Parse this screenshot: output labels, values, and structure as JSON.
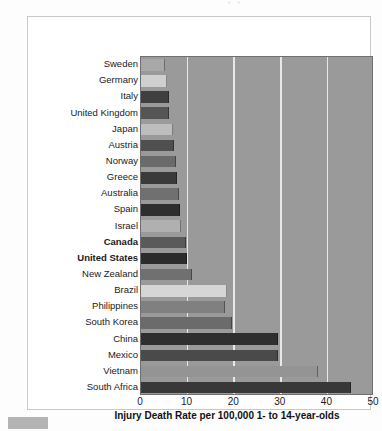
{
  "figure": {
    "top_fragment": "· ·",
    "corner_artifact_name": "scan-artifact-block"
  },
  "chart_data": {
    "type": "bar",
    "orientation": "horizontal",
    "title": "",
    "xlabel": "Injury Death Rate per 100,000 1- to 14-year-olds",
    "ylabel": "",
    "xlim": [
      0,
      50
    ],
    "xticks": [
      0,
      10,
      20,
      30,
      40,
      50
    ],
    "xtick_labels": [
      "0",
      "10",
      "20",
      "30",
      "40",
      "50"
    ],
    "grid": true,
    "grid_axis": "x",
    "legend": "none",
    "plot_background": "#9a9a9a",
    "gridline_color": "#e8e8e8",
    "categories": [
      "Sweden",
      "Germany",
      "Italy",
      "United Kingdom",
      "Japan",
      "Austria",
      "Norway",
      "Greece",
      "Australia",
      "Spain",
      "Israel",
      "Canada",
      "United States",
      "New Zealand",
      "Brazil",
      "Philippines",
      "South Korea",
      "China",
      "Mexico",
      "Vietnam",
      "South Africa"
    ],
    "values": [
      5.2,
      5.5,
      6.1,
      6.1,
      6.8,
      7.0,
      7.6,
      7.8,
      8.2,
      8.3,
      8.6,
      9.7,
      9.8,
      11.0,
      18.5,
      18.0,
      19.5,
      29.5,
      29.5,
      38.0,
      45.0
    ],
    "highlighted": [
      "Canada",
      "United States"
    ],
    "bar_colors": [
      "#a8a8a8",
      "#cfcfcf",
      "#3f3f3f",
      "#555555",
      "#bdbdbd",
      "#4f4f4f",
      "#6a6a6a",
      "#3a3a3a",
      "#707070",
      "#2e2e2e",
      "#b0b0b0",
      "#5a5a5a",
      "#2b2b2b",
      "#707070",
      "#d6d6d6",
      "#808080",
      "#6b6b6b",
      "#2f2f2f",
      "#4a4a4a",
      "#949494",
      "#383838"
    ]
  }
}
